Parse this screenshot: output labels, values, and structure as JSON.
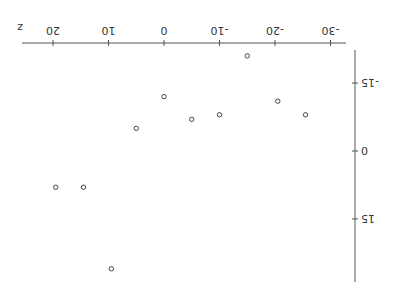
{
  "chart_data": {
    "type": "scatter",
    "title": "",
    "xlabel": "z",
    "ylabel": "",
    "rotation_deg": 180,
    "x_axis": {
      "ticks": [
        -30,
        -20,
        -10,
        0,
        10,
        20
      ],
      "tick_labels": [
        "-30",
        "-20",
        "-10",
        "0",
        "10",
        "20"
      ],
      "range": [
        -33,
        25
      ]
    },
    "y_axis": {
      "ticks": [
        -15,
        0,
        15
      ],
      "tick_labels": [
        "-15",
        "0",
        "15"
      ],
      "range": [
        -22,
        29
      ]
    },
    "grid": false,
    "legend": null,
    "marker": "open-circle",
    "series": [
      {
        "name": "points",
        "points": [
          {
            "x": -15,
            "y": -21
          },
          {
            "x": 0,
            "y": -12
          },
          {
            "x": -20.5,
            "y": -11
          },
          {
            "x": -5,
            "y": -7
          },
          {
            "x": -10,
            "y": -8
          },
          {
            "x": -25.5,
            "y": -8
          },
          {
            "x": 5,
            "y": -5
          },
          {
            "x": 19.5,
            "y": 8
          },
          {
            "x": 14.5,
            "y": 8
          },
          {
            "x": 9.5,
            "y": 26
          }
        ]
      }
    ],
    "colors": {
      "axis": "#555555",
      "marker": "#444444",
      "text": "#333333"
    }
  },
  "labels": {
    "x_axis_title": "z",
    "x_ticks": [
      "-30",
      "-20",
      "-10",
      "0",
      "10",
      "20"
    ],
    "y_ticks": [
      "-15",
      "0",
      "15"
    ]
  }
}
